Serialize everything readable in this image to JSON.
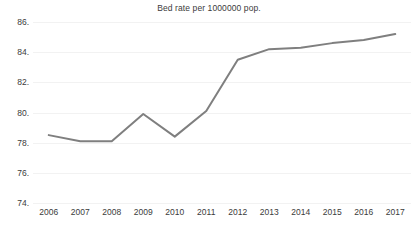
{
  "chart_data": {
    "type": "line",
    "title": "Bed rate per 1000000 pop.",
    "xlabel": "",
    "ylabel": "",
    "categories": [
      "2006",
      "2007",
      "2008",
      "2009",
      "2010",
      "2011",
      "2012",
      "2013",
      "2014",
      "2015",
      "2016",
      "2017"
    ],
    "values": [
      78.5,
      78.1,
      78.1,
      79.9,
      78.4,
      80.1,
      83.5,
      84.2,
      84.3,
      84.6,
      84.8,
      85.2
    ],
    "series": [
      {
        "name": "Bed rate per 1000000 pop.",
        "color": "#7f7f7f",
        "values": [
          78.5,
          78.1,
          78.1,
          79.9,
          78.4,
          80.1,
          83.5,
          84.2,
          84.3,
          84.6,
          84.8,
          85.2
        ]
      }
    ],
    "ylim": [
      74,
      86
    ],
    "yticks": [
      74,
      76,
      78,
      80,
      82,
      84,
      86
    ],
    "ytick_labels": [
      "74.",
      "76.",
      "78.",
      "80.",
      "82.",
      "84.",
      "86."
    ],
    "xtick_labels": [
      "2006",
      "2007",
      "2008",
      "2009",
      "2010",
      "2011",
      "2012",
      "2013",
      "2014",
      "2015",
      "2016",
      "2017"
    ],
    "grid": true,
    "grid_color": "#f2f2f2",
    "legend": false,
    "legend_position": "none",
    "background": "#ffffff",
    "text_color": "#3b3b3b"
  }
}
